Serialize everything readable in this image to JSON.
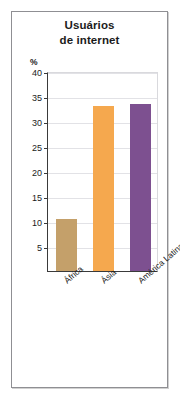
{
  "figure": {
    "title_lines": [
      "Usuários",
      "de internet"
    ],
    "unit_label": "%"
  },
  "chart_data": {
    "type": "bar",
    "title": "Usuários de internet",
    "xlabel": "",
    "ylabel": "%",
    "ylim": [
      0,
      40
    ],
    "yticks": [
      5,
      10,
      15,
      20,
      25,
      30,
      35,
      40
    ],
    "ytick_labels": [
      "5",
      "10",
      "15",
      "20",
      "25",
      "30",
      "35",
      "40"
    ],
    "grid": true,
    "legend": "none",
    "categories": [
      "África",
      "Ásia",
      "América Latina e Caribe"
    ],
    "values": [
      10.5,
      33.0,
      33.5
    ],
    "colors": [
      "#c4a06a",
      "#f5a84e",
      "#7d5090"
    ],
    "bars": [
      {
        "category": "África",
        "value": 10.5,
        "color": "#c4a06a"
      },
      {
        "category": "Ásia",
        "value": 33.0,
        "color": "#f5a84e"
      },
      {
        "category": "América Latina e Caribe",
        "value": 33.5,
        "color": "#7d5090"
      }
    ]
  }
}
